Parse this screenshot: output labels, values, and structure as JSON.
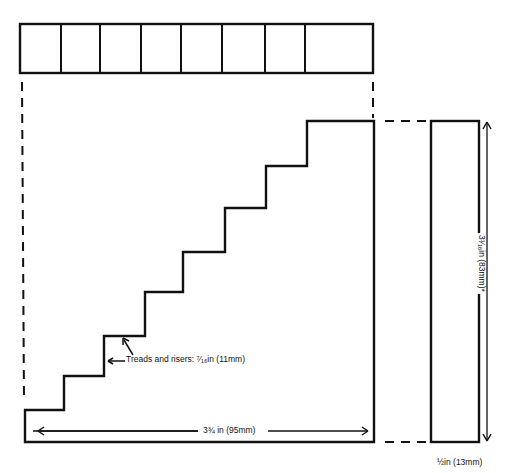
{
  "diagram": {
    "title": "",
    "top_view": {
      "segments": 8,
      "divider_x": [
        61,
        100,
        141,
        181,
        222,
        265,
        305
      ],
      "rect": {
        "x": 20,
        "y": 24,
        "w": 353,
        "h": 49
      }
    },
    "side_profile": {
      "steps": 8,
      "outline_points": [
        [
          25,
          410
        ],
        [
          64,
          410
        ],
        [
          64,
          376
        ],
        [
          104,
          376
        ],
        [
          104,
          336
        ],
        [
          145,
          336
        ],
        [
          145,
          292
        ],
        [
          183,
          292
        ],
        [
          183,
          252
        ],
        [
          225,
          252
        ],
        [
          225,
          208
        ],
        [
          266,
          208
        ],
        [
          266,
          166
        ],
        [
          307,
          166
        ],
        [
          307,
          121
        ],
        [
          374,
          121
        ],
        [
          374,
          442
        ],
        [
          25,
          442
        ]
      ]
    },
    "end_view": {
      "rect": {
        "x": 431,
        "y": 121,
        "w": 48,
        "h": 321
      }
    },
    "colors": {
      "line": "#111111",
      "background": "#ffffff"
    }
  },
  "labels": {
    "treads_and_risers": "Treads and risers: ⁷⁄₁₆in (11mm)",
    "overall_width": "3¾ in (95mm)",
    "overall_height": "3¹⁄₁₆in (83mm)*",
    "thickness": "½in (13mm)"
  }
}
